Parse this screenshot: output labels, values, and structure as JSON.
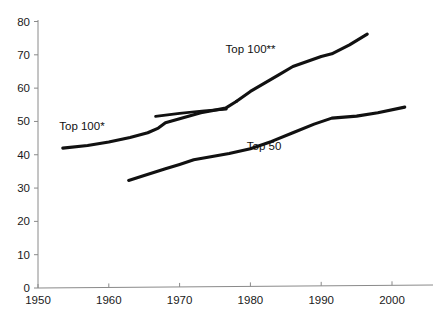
{
  "chart_data": {
    "type": "line",
    "title": "",
    "xlabel": "",
    "ylabel": "",
    "xlim": [
      1950,
      2005
    ],
    "ylim": [
      0,
      80
    ],
    "grid": false,
    "legend": "inline-annotations",
    "x_ticks": [
      1950,
      1960,
      1970,
      1980,
      1990,
      2000
    ],
    "y_ticks": [
      0,
      10,
      20,
      30,
      40,
      50,
      60,
      70,
      80
    ],
    "series": [
      {
        "name": "Top 100*",
        "label": "Top 100*",
        "color": "#111111",
        "points": [
          [
            1953.5,
            42.0
          ],
          [
            1957.0,
            42.8
          ],
          [
            1960.0,
            43.8
          ],
          [
            1963.0,
            45.2
          ],
          [
            1965.5,
            46.6
          ],
          [
            1967.0,
            48.0
          ],
          [
            1968.0,
            49.6
          ],
          [
            1970.0,
            50.8
          ],
          [
            1973.0,
            52.6
          ],
          [
            1976.5,
            54.0
          ],
          [
            1978.0,
            56.0
          ]
        ]
      },
      {
        "name": "Top 100**",
        "label": "Top 100**",
        "color": "#111111",
        "points": [
          [
            1978.0,
            56.0
          ],
          [
            1980.0,
            59.0
          ],
          [
            1982.0,
            61.5
          ],
          [
            1984.0,
            64.0
          ],
          [
            1986.0,
            66.5
          ],
          [
            1988.0,
            68.0
          ],
          [
            1990.0,
            69.5
          ],
          [
            1991.5,
            70.3
          ],
          [
            1994.0,
            73.0
          ],
          [
            1996.5,
            76.2
          ]
        ]
      },
      {
        "name": "Top 100 overlap segment",
        "label": "",
        "color": "#111111",
        "points": [
          [
            1966.6,
            51.5
          ],
          [
            1970.0,
            52.4
          ],
          [
            1973.5,
            53.2
          ],
          [
            1976.6,
            53.7
          ]
        ]
      },
      {
        "name": "Top 50",
        "label": "Top 50",
        "color": "#111111",
        "points": [
          [
            1962.8,
            32.3
          ],
          [
            1965.0,
            33.8
          ],
          [
            1968.0,
            35.8
          ],
          [
            1970.0,
            37.1
          ],
          [
            1972.0,
            38.5
          ],
          [
            1975.0,
            39.6
          ],
          [
            1977.0,
            40.4
          ],
          [
            1980.0,
            41.8
          ],
          [
            1983.0,
            44.0
          ],
          [
            1986.0,
            46.6
          ],
          [
            1989.0,
            49.2
          ],
          [
            1991.5,
            51.0
          ],
          [
            1995.0,
            51.6
          ],
          [
            1998.0,
            52.6
          ],
          [
            2001.8,
            54.3
          ]
        ]
      }
    ],
    "annotations": [
      {
        "text": "Top 100*",
        "x": 1953.0,
        "y": 47.5,
        "anchor": "start"
      },
      {
        "text": "Top 100**",
        "x": 1976.5,
        "y": 70.5,
        "anchor": "start"
      },
      {
        "text": "Top 50",
        "x": 1979.5,
        "y": 41.5,
        "anchor": "start"
      }
    ]
  },
  "axis": {
    "y_tick_labels": [
      "80",
      "70",
      "60",
      "50",
      "40",
      "30",
      "20",
      "10",
      "0"
    ],
    "x_tick_labels": [
      "1950",
      "1960",
      "1970",
      "1980",
      "1990",
      "2000"
    ],
    "axis_color": "#8a8a8a"
  }
}
